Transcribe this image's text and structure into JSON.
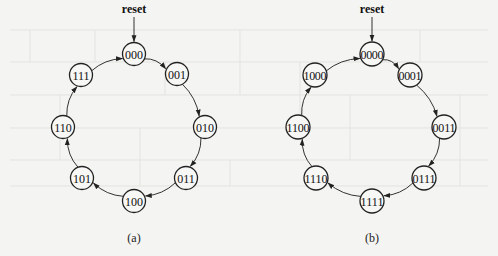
{
  "diagrams": [
    {
      "id": "a",
      "caption": "(a)",
      "reset_label": "reset",
      "states": [
        "000",
        "001",
        "010",
        "011",
        "100",
        "101",
        "110",
        "111"
      ],
      "initial_state": "000",
      "transitions": [
        [
          "000",
          "001"
        ],
        [
          "001",
          "010"
        ],
        [
          "010",
          "011"
        ],
        [
          "011",
          "100"
        ],
        [
          "100",
          "101"
        ],
        [
          "101",
          "110"
        ],
        [
          "110",
          "111"
        ],
        [
          "111",
          "000"
        ]
      ]
    },
    {
      "id": "b",
      "caption": "(b)",
      "reset_label": "reset",
      "states": [
        "0000",
        "0001",
        "0011",
        "0111",
        "1111",
        "1110",
        "1100",
        "1000"
      ],
      "initial_state": "0000",
      "transitions": [
        [
          "0000",
          "0001"
        ],
        [
          "0001",
          "0011"
        ],
        [
          "0011",
          "0111"
        ],
        [
          "0111",
          "1111"
        ],
        [
          "1111",
          "1110"
        ],
        [
          "1110",
          "1100"
        ],
        [
          "1100",
          "1000"
        ],
        [
          "1000",
          "0000"
        ]
      ]
    }
  ]
}
